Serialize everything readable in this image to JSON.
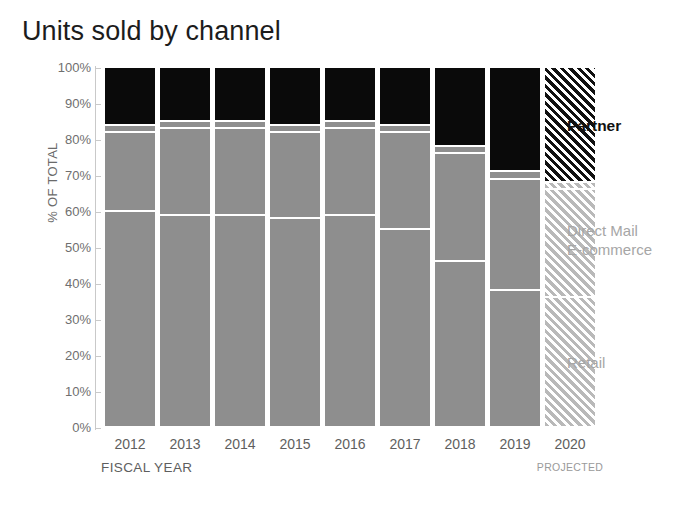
{
  "chart_data": {
    "type": "bar",
    "subtype": "stacked-bar-100-percent",
    "title": "Units sold by channel",
    "xlabel": "FISCAL YEAR",
    "ylabel": "% OF TOTAL",
    "ylim": [
      0,
      100
    ],
    "ytick_labels": [
      "100%",
      "90%",
      "80%",
      "70%",
      "60%",
      "50%",
      "40%",
      "30%",
      "20%",
      "10%",
      "0%"
    ],
    "ytick_values": [
      100,
      90,
      80,
      70,
      60,
      50,
      40,
      30,
      20,
      10,
      0
    ],
    "grid": false,
    "legend_position": "right",
    "categories": [
      "2012",
      "2013",
      "2014",
      "2015",
      "2016",
      "2017",
      "2018",
      "2019",
      "2020"
    ],
    "projected_categories": [
      "2020"
    ],
    "projected_note": "PROJECTED",
    "series": [
      {
        "name": "Partner",
        "color": "#0a0a0a",
        "values": [
          16,
          15,
          15,
          16,
          15,
          16,
          22,
          29,
          32
        ]
      },
      {
        "name": "Direct Mail",
        "color": "#8e8e8e",
        "values": [
          2,
          2,
          2,
          2,
          2,
          2,
          2,
          2,
          2
        ]
      },
      {
        "name": "E-commerce",
        "color": "#8e8e8e",
        "values": [
          22,
          24,
          24,
          24,
          24,
          27,
          30,
          31,
          30
        ]
      },
      {
        "name": "Retail",
        "color": "#8e8e8e",
        "values": [
          60,
          59,
          59,
          58,
          59,
          55,
          46,
          38,
          36
        ]
      }
    ],
    "annotations": []
  },
  "legend": {
    "items": [
      {
        "label": "Partner",
        "style": "bold-dark"
      },
      {
        "label": "Direct Mail",
        "style": "muted"
      },
      {
        "label": "E-commerce",
        "style": "muted"
      },
      {
        "label": "Retail",
        "style": "muted"
      }
    ]
  }
}
